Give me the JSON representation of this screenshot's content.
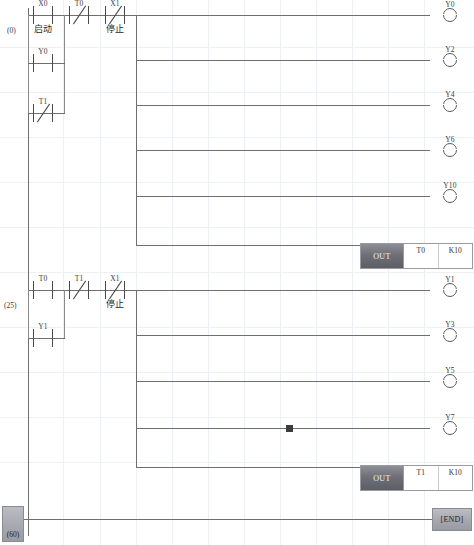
{
  "editor": {
    "type": "plc-ladder-diagram",
    "end_label": "[END]",
    "end_step": "(60)"
  },
  "rungs": [
    {
      "step": "(0)",
      "contacts": [
        {
          "label": "X0",
          "kind": "no",
          "comment": "启动"
        },
        {
          "label": "T0",
          "kind": "nc",
          "comment": ""
        },
        {
          "label": "X1",
          "kind": "nc",
          "comment": "停止"
        }
      ],
      "branches": [
        {
          "label": "Y0",
          "kind": "no"
        },
        {
          "label": "T1",
          "kind": "nc"
        }
      ],
      "coils": [
        "Y0",
        "Y2",
        "Y4",
        "Y6",
        "Y10"
      ],
      "instruction": {
        "op": "OUT",
        "arg1": "T0",
        "arg2": "K10"
      }
    },
    {
      "step": "(25)",
      "contacts": [
        {
          "label": "T0",
          "kind": "no",
          "comment": ""
        },
        {
          "label": "T1",
          "kind": "nc",
          "comment": ""
        },
        {
          "label": "X1",
          "kind": "nc",
          "comment": "停止"
        }
      ],
      "branches": [
        {
          "label": "Y1",
          "kind": "no"
        }
      ],
      "coils": [
        "Y1",
        "Y3",
        "Y5",
        "Y7"
      ],
      "instruction": {
        "op": "OUT",
        "arg1": "T1",
        "arg2": "K10"
      }
    }
  ],
  "colors": {
    "wire": "#6f6f6f",
    "grid": "#eceff3",
    "block_face": "#6f6f77",
    "highlight": "#a8a8b0"
  }
}
